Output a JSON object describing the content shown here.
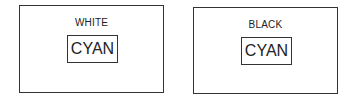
{
  "panels": [
    {
      "background_label": "WHITE",
      "text_label": "CYAN"
    },
    {
      "background_label": "BLACK",
      "text_label": "CYAN"
    }
  ]
}
